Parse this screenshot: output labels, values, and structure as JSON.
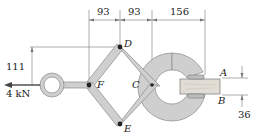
{
  "diagram": {
    "type": "mechanism-figure",
    "points": {
      "A": "A",
      "B": "B",
      "C": "C",
      "D": "D",
      "E": "E",
      "F": "F"
    },
    "dimensions": {
      "d1": "93",
      "d2": "93",
      "d3": "156",
      "vertical": "111",
      "thickness": "36"
    },
    "load": {
      "label": "4 kN"
    },
    "colors": {
      "link_fill": "#cfcfcf",
      "link_stroke": "#8a8a8a",
      "line": "#555555",
      "board": "#e2ddd4",
      "text": "#222222"
    }
  }
}
